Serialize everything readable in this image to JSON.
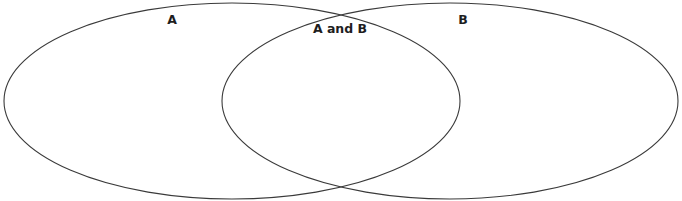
{
  "diagram": {
    "type": "venn",
    "sets": [
      {
        "id": "A",
        "label": "A",
        "cx": 232,
        "cy": 101,
        "rx": 228,
        "ry": 98,
        "label_x": 172,
        "label_y": 24
      },
      {
        "id": "B",
        "label": "B",
        "cx": 450,
        "cy": 101,
        "rx": 228,
        "ry": 98,
        "label_x": 463,
        "label_y": 24
      }
    ],
    "intersection": {
      "label": "A and B",
      "label_x": 340,
      "label_y": 33
    },
    "colors": {
      "stroke": "#3a3a3a",
      "text": "#1e1e1e",
      "background": "#ffffff"
    }
  }
}
